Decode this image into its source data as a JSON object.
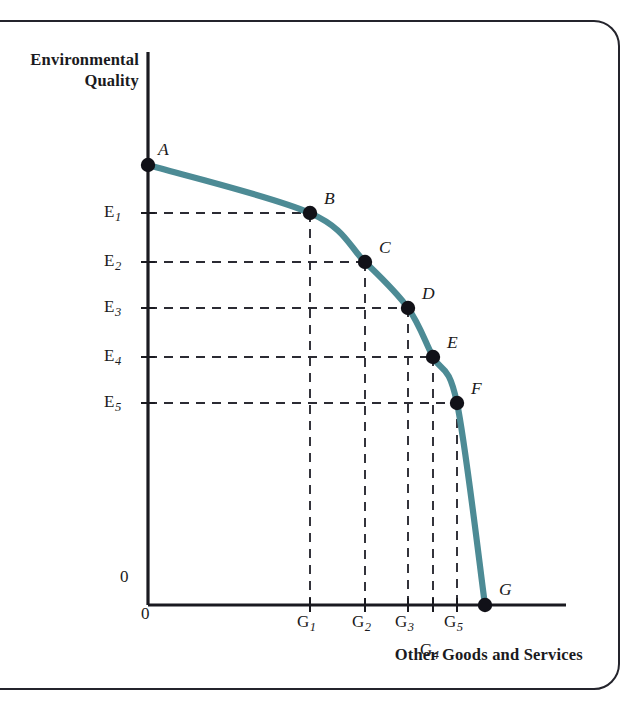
{
  "figure": {
    "kind": "production-possibilities-frontier",
    "y_axis_title": "Environmental\nQuality",
    "x_axis_title": "Other Goods and Services",
    "origin_label_y": "0",
    "origin_label_x": "0"
  },
  "colors": {
    "curve": "#4d8b95",
    "axis": "#1a1a20",
    "guide": "#2b2b33",
    "point": "#111118",
    "frame": "#24242c",
    "text": "#1a1a20",
    "background": "#ffffff"
  },
  "chart_data": {
    "type": "line",
    "title": "",
    "subtitle": "",
    "xlabel": "Other Goods and Services",
    "ylabel": "Environmental Quality",
    "grid": false,
    "legend": null,
    "xlim": [
      0,
      1
    ],
    "ylim": [
      0,
      1
    ],
    "x_tick_labels": [
      "0",
      "G1",
      "G2",
      "G3",
      "G4",
      "G5"
    ],
    "y_tick_labels": [
      "0",
      "E5",
      "E4",
      "E3",
      "E2",
      "E1"
    ],
    "annotations": [
      "A",
      "B",
      "C",
      "D",
      "E",
      "F",
      "G"
    ],
    "note": "Concave production possibilities frontier; points A-G lie on the curve. A is the vertical intercept, G the horizontal intercept.",
    "points": [
      {
        "name": "A",
        "x_label": "0",
        "y_label": "",
        "px": 148,
        "py": 165,
        "label_dx": 10,
        "label_dy": -26,
        "guide_h": false,
        "guide_v": false
      },
      {
        "name": "B",
        "x_label": "G1",
        "y_label": "E1",
        "px": 310,
        "py": 213,
        "label_dx": 14,
        "label_dy": -25,
        "guide_h": true,
        "guide_v": true
      },
      {
        "name": "C",
        "x_label": "G2",
        "y_label": "E2",
        "px": 365,
        "py": 262,
        "label_dx": 14,
        "label_dy": -25,
        "guide_h": true,
        "guide_v": true
      },
      {
        "name": "D",
        "x_label": "G3",
        "y_label": "E3",
        "px": 408,
        "py": 308,
        "label_dx": 14,
        "label_dy": -25,
        "guide_h": true,
        "guide_v": true
      },
      {
        "name": "E",
        "x_label": "G4",
        "y_label": "E4",
        "px": 433,
        "py": 357,
        "label_dx": 14,
        "label_dy": -25,
        "guide_h": true,
        "guide_v": true
      },
      {
        "name": "F",
        "x_label": "G5",
        "y_label": "E5",
        "px": 457,
        "py": 403,
        "label_dx": 14,
        "label_dy": -25,
        "guide_h": true,
        "guide_v": true
      },
      {
        "name": "G",
        "x_label": "",
        "y_label": "0",
        "px": 485,
        "py": 605,
        "label_dx": 14,
        "label_dy": -26,
        "guide_h": false,
        "guide_v": false
      }
    ],
    "y_ticks": [
      {
        "label": "E",
        "sub": "1",
        "py": 213
      },
      {
        "label": "E",
        "sub": "2",
        "py": 262
      },
      {
        "label": "E",
        "sub": "3",
        "py": 308
      },
      {
        "label": "E",
        "sub": "4",
        "py": 357
      },
      {
        "label": "E",
        "sub": "5",
        "py": 403
      }
    ],
    "x_ticks": [
      {
        "label": "G",
        "sub": "1",
        "px": 310,
        "row": 0
      },
      {
        "label": "G",
        "sub": "2",
        "px": 365,
        "row": 0
      },
      {
        "label": "G",
        "sub": "3",
        "px": 408,
        "row": 0
      },
      {
        "label": "G",
        "sub": "5",
        "px": 457,
        "row": 0
      },
      {
        "label": "G",
        "sub": "4",
        "px": 433,
        "row": 1
      }
    ]
  },
  "geometry": {
    "axis_x": 148,
    "axis_y": 605,
    "y_axis_top": 52,
    "x_axis_right": 566
  }
}
